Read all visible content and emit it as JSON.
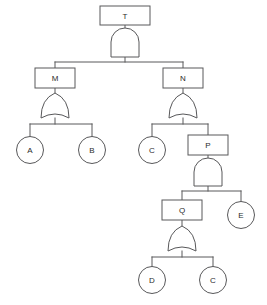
{
  "diagram": {
    "kind": "fault-tree",
    "title": "",
    "colors": {
      "background": "#ffffff",
      "stroke": "#58585a",
      "text": "#2b2b2b",
      "fill": "#ffffff"
    }
  },
  "nodes": {
    "T": {
      "label": "T",
      "shape": "rect"
    },
    "M": {
      "label": "M",
      "shape": "rect"
    },
    "N": {
      "label": "N",
      "shape": "rect"
    },
    "A": {
      "label": "A",
      "shape": "circle"
    },
    "B": {
      "label": "B",
      "shape": "circle"
    },
    "C1": {
      "label": "C",
      "shape": "circle"
    },
    "P": {
      "label": "P",
      "shape": "rect"
    },
    "Q": {
      "label": "Q",
      "shape": "rect"
    },
    "E": {
      "label": "E",
      "shape": "circle"
    },
    "D": {
      "label": "D",
      "shape": "circle"
    },
    "C2": {
      "label": "C",
      "shape": "circle"
    }
  },
  "gates": {
    "gate_T": {
      "type": "AND",
      "parent": "T",
      "children": [
        "M",
        "N"
      ]
    },
    "gate_M": {
      "type": "OR",
      "parent": "M",
      "children": [
        "A",
        "B"
      ]
    },
    "gate_N": {
      "type": "OR",
      "parent": "N",
      "children": [
        "C1",
        "P"
      ]
    },
    "gate_P": {
      "type": "AND",
      "parent": "P",
      "children": [
        "Q",
        "E"
      ]
    },
    "gate_Q": {
      "type": "OR",
      "parent": "Q",
      "children": [
        "D",
        "C2"
      ]
    }
  }
}
